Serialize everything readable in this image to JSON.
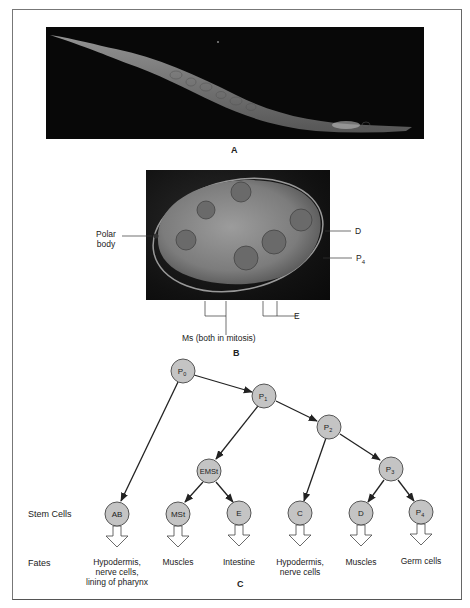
{
  "figure": {
    "panels": {
      "A": {
        "label": "A",
        "description": "micrograph of adult nematode worm (C. elegans)"
      },
      "B": {
        "label": "B",
        "description": "micrograph of early embryo",
        "annotations": {
          "polar_body_line1": "Polar",
          "polar_body_line2": "body",
          "D": "D",
          "P4": "P",
          "P4_sub": "4",
          "E": "E",
          "Ms": "Ms (both in mitosis)"
        }
      },
      "C": {
        "label": "C",
        "row_labels": {
          "stem_cells": "Stem Cells",
          "fates": "Fates"
        },
        "nodes": [
          {
            "id": "P0",
            "label": "P",
            "sub": "0"
          },
          {
            "id": "P1",
            "label": "P",
            "sub": "1"
          },
          {
            "id": "P2",
            "label": "P",
            "sub": "2"
          },
          {
            "id": "P3",
            "label": "P",
            "sub": "3"
          },
          {
            "id": "EMSt",
            "label": "EMSt",
            "sub": ""
          },
          {
            "id": "AB",
            "label": "AB",
            "sub": ""
          },
          {
            "id": "MSt",
            "label": "MSt",
            "sub": ""
          },
          {
            "id": "E",
            "label": "E",
            "sub": ""
          },
          {
            "id": "C",
            "label": "C",
            "sub": ""
          },
          {
            "id": "D",
            "label": "D",
            "sub": ""
          },
          {
            "id": "P4",
            "label": "P",
            "sub": "4"
          }
        ],
        "edges": [
          [
            "P0",
            "P1"
          ],
          [
            "P0",
            "AB"
          ],
          [
            "P1",
            "P2"
          ],
          [
            "P1",
            "EMSt"
          ],
          [
            "EMSt",
            "MSt"
          ],
          [
            "EMSt",
            "E"
          ],
          [
            "P2",
            "C"
          ],
          [
            "P2",
            "P3"
          ],
          [
            "P3",
            "D"
          ],
          [
            "P3",
            "P4"
          ]
        ],
        "fates": [
          {
            "cell": "AB",
            "line1": "Hypodermis,",
            "line2": "nerve cells,",
            "line3": "lining of pharynx"
          },
          {
            "cell": "MSt",
            "line1": "Muscles",
            "line2": "",
            "line3": ""
          },
          {
            "cell": "E",
            "line1": "Intestine",
            "line2": "",
            "line3": ""
          },
          {
            "cell": "C",
            "line1": "Hypodermis,",
            "line2": "nerve cells",
            "line3": ""
          },
          {
            "cell": "D",
            "line1": "Muscles",
            "line2": "",
            "line3": ""
          },
          {
            "cell": "P4",
            "line1": "Germ cells",
            "line2": "",
            "line3": ""
          }
        ]
      }
    },
    "colors": {
      "node_fill": "#c4c4c4",
      "node_stroke": "#555555",
      "line": "#222222",
      "frame": "#777777"
    }
  }
}
